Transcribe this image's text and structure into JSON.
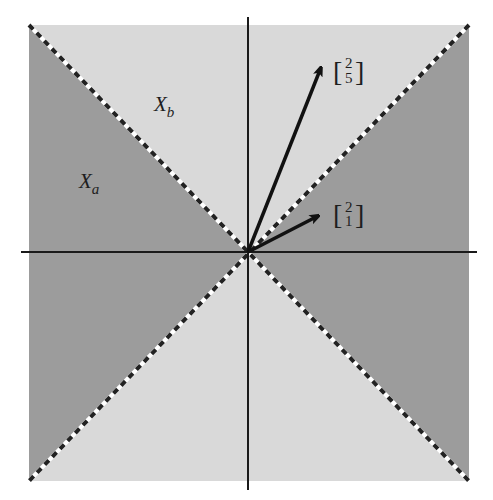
{
  "figure": {
    "colors": {
      "region_a": "#9c9c9c",
      "region_b": "#d9d9d9",
      "axis": "#1a1a1a",
      "vector": "#111111",
      "dash_dark": "#222222",
      "dash_light": "#ffffff"
    },
    "regions": [
      {
        "name": "X_a",
        "label_main": "X",
        "label_sub": "a",
        "description": "left and right triangles (|x| > |y|)"
      },
      {
        "name": "X_b",
        "label_main": "X",
        "label_sub": "b",
        "description": "top and bottom triangles (|y| > |x|)"
      }
    ],
    "vectors": [
      {
        "name": "v1",
        "x": 2,
        "y": 5,
        "label_top": "2",
        "label_bottom": "5"
      },
      {
        "name": "v2",
        "x": 2,
        "y": 1,
        "label_top": "2",
        "label_bottom": "1"
      }
    ],
    "diagonals": [
      "y = x",
      "y = -x"
    ],
    "bracket_left": "[",
    "bracket_right": "]"
  }
}
